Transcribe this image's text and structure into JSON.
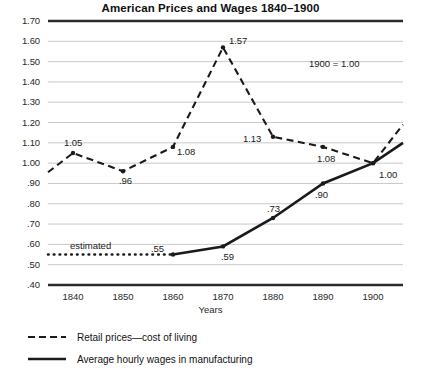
{
  "chart_data": {
    "type": "line",
    "title": "American Prices and Wages 1840–1900",
    "xlabel": "Years",
    "ylabel": "",
    "x": [
      1840,
      1850,
      1860,
      1870,
      1880,
      1890,
      1900
    ],
    "xlim": [
      1835,
      1906
    ],
    "ylim": [
      0.4,
      1.7
    ],
    "ytick_labels": [
      "1.70",
      "1.60",
      "1.50",
      "1.40",
      "1.30",
      "1.20",
      "1.10",
      "1.00",
      ".90",
      ".80",
      ".70",
      ".60",
      ".50",
      ".40"
    ],
    "ytick_values": [
      1.7,
      1.6,
      1.5,
      1.4,
      1.3,
      1.2,
      1.1,
      1.0,
      0.9,
      0.8,
      0.7,
      0.6,
      0.5,
      0.4
    ],
    "xtick_labels": [
      "1840",
      "1850",
      "1860",
      "1870",
      "1880",
      "1890",
      "1900"
    ],
    "grid": true,
    "legend_position": "below-plot",
    "annotation": "1900 = 1.00",
    "estimated_label": "estimated",
    "series": [
      {
        "name": "Retail prices—cost of living",
        "style": "dashed",
        "values": [
          1.05,
          0.96,
          1.08,
          1.57,
          1.13,
          1.08,
          1.0
        ],
        "point_labels": [
          "1.05",
          ".96",
          "1.08",
          "1.57",
          "1.13",
          "1.08",
          "1.00"
        ]
      },
      {
        "name": "Average hourly wages in manufacturing",
        "style": "solid",
        "values": [
          null,
          null,
          0.55,
          0.59,
          0.73,
          0.9,
          1.0
        ],
        "point_labels": [
          "",
          "",
          ".55",
          ".59",
          ".73",
          ".90",
          "1.00"
        ],
        "estimated_segment": {
          "style": "dotted",
          "value": 0.55,
          "from_x": 1835,
          "to_x": 1860
        }
      }
    ],
    "colors": {
      "ink": "#1a1a1a",
      "grid": "#c9c9c9",
      "rule": "#2b2b2b"
    }
  },
  "legend": {
    "items": [
      {
        "label": "Retail prices—cost of living",
        "style": "dashed"
      },
      {
        "label": "Average hourly wages in manufacturing",
        "style": "solid"
      }
    ]
  }
}
